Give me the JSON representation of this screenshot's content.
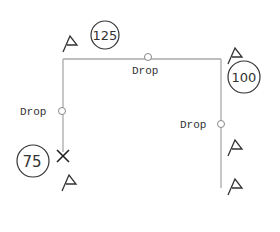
{
  "diagram": {
    "colors": {
      "line": "#a9a9a9",
      "ink": "#333333",
      "background": "#ffffff"
    },
    "path": {
      "top_left": [
        63,
        59
      ],
      "top_right": [
        221,
        59
      ],
      "left_bottom": [
        63,
        156
      ],
      "right_bottom": [
        221,
        188
      ]
    },
    "drops": [
      {
        "label": "Drop",
        "x": 148,
        "y": 57,
        "label_x": 132,
        "label_y": 73
      },
      {
        "label": "Drop",
        "x": 62,
        "y": 111,
        "label_x": 20,
        "label_y": 115
      },
      {
        "label": "Drop",
        "x": 221,
        "y": 124,
        "label_x": 180,
        "label_y": 128
      }
    ],
    "badges": [
      {
        "value": "125",
        "cx": 105,
        "cy": 35,
        "r": 14
      },
      {
        "value": "100",
        "cx": 244,
        "cy": 77,
        "r": 16
      },
      {
        "value": "75",
        "cx": 33,
        "cy": 161,
        "r": 16
      }
    ],
    "flags": [
      {
        "x": 63,
        "y": 50
      },
      {
        "x": 229,
        "y": 62
      },
      {
        "x": 229,
        "y": 150
      },
      {
        "x": 63,
        "y": 191
      },
      {
        "x": 229,
        "y": 190
      }
    ],
    "end_marker": {
      "type": "x",
      "x": 63,
      "y": 156
    }
  }
}
